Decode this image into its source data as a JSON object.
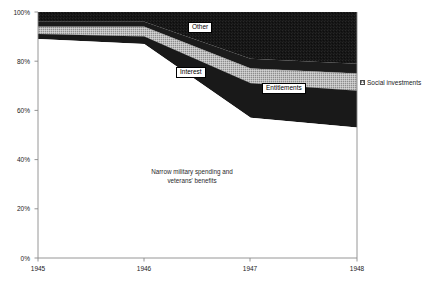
{
  "chart_data": {
    "type": "area",
    "title": "",
    "subtitle": "",
    "xlabel": "",
    "ylabel": "",
    "stacked": true,
    "normalized_percent": true,
    "grid": false,
    "legend_position": "right",
    "x": [
      1945,
      1946,
      1947,
      1948
    ],
    "xtick_labels": [
      "1945",
      "1946",
      "1947",
      "1948"
    ],
    "xlim": [
      1945,
      1948
    ],
    "ylim": [
      0,
      100
    ],
    "ytick_labels": [
      "0%",
      "20%",
      "40%",
      "60%",
      "80%",
      "100%"
    ],
    "ytick_values": [
      0,
      20,
      40,
      60,
      80,
      100
    ],
    "series": [
      {
        "name": "Narrow military spending and veterans' benefits",
        "label_in_plot": "Narrow military spending and\nveterans' benefits",
        "fill": "#ffffff",
        "values": [
          89,
          87,
          57,
          53
        ]
      },
      {
        "name": "Entitlements",
        "label_in_plot": "Entitlements",
        "fill": "#1c1c1c",
        "values": [
          2,
          3,
          14,
          15
        ]
      },
      {
        "name": "Social investments",
        "label_in_plot": "",
        "fill": "#8d8d8d",
        "pattern": "cross-hatch",
        "values": [
          3,
          4,
          6,
          7
        ]
      },
      {
        "name": "Interest",
        "label_in_plot": "Interest",
        "fill": "#1c1c1c",
        "values": [
          2,
          2,
          4,
          4
        ]
      },
      {
        "name": "Other",
        "label_in_plot": "Other",
        "fill": "#141414",
        "values": [
          4,
          4,
          19,
          21
        ]
      }
    ],
    "cumulative_upper_boundaries_percent": {
      "military_veterans": [
        89,
        87,
        57,
        53
      ],
      "plus_entitlements": [
        91,
        90,
        71,
        68
      ],
      "plus_social_investments": [
        94,
        94,
        77,
        75
      ],
      "plus_interest": [
        96,
        96,
        81,
        79
      ],
      "plus_other": [
        100,
        100,
        100,
        100
      ]
    },
    "annotations": [
      {
        "name": "other-label",
        "text": "Other"
      },
      {
        "name": "interest-label",
        "text": "Interest"
      },
      {
        "name": "entitlements-label",
        "text": "Entitlements"
      },
      {
        "name": "military-label-line1",
        "text": "Narrow military spending and"
      },
      {
        "name": "military-label-line2",
        "text": "veterans' benefits"
      }
    ],
    "legend_entries": [
      {
        "label": "Social investments",
        "swatch": "cross-hatch-gray",
        "color": "#8d8d8d"
      }
    ],
    "colors": {
      "dark_fill": "#1c1c1c",
      "gray_hatch": "#8d8d8d",
      "white_fill": "#ffffff",
      "axis": "#8a8a8a",
      "text": "#1a1a1a"
    }
  },
  "yticks": [
    {
      "label": "100%"
    },
    {
      "label": "80%"
    },
    {
      "label": "60%"
    },
    {
      "label": "40%"
    },
    {
      "label": "20%"
    },
    {
      "label": "0%"
    }
  ],
  "xticks": [
    {
      "label": "1945"
    },
    {
      "label": "1946"
    },
    {
      "label": "1947"
    },
    {
      "label": "1948"
    }
  ],
  "labels": {
    "other": "Other",
    "interest": "Interest",
    "entitlements": "Entitlements",
    "military_line1": "Narrow military spending and",
    "military_line2": "veterans' benefits"
  },
  "legend": {
    "social_investments": "Social investments"
  }
}
